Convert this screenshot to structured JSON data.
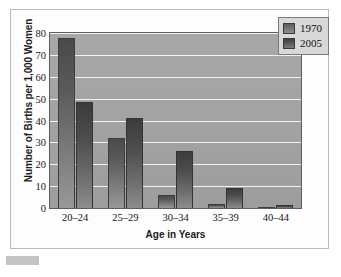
{
  "chart_data": {
    "type": "bar",
    "title": "",
    "xlabel": "Age in Years",
    "ylabel": "Number of Births per 1,000 Women",
    "categories": [
      "20–24",
      "25–29",
      "30–34",
      "35–39",
      "40–44"
    ],
    "series": [
      {
        "name": "1970",
        "values": [
          77.5,
          32,
          6,
          2,
          0.5
        ],
        "color": "#5a5a5a"
      },
      {
        "name": "2005",
        "values": [
          48.5,
          41,
          26,
          9,
          1.5
        ],
        "color": "#4e4e4e"
      }
    ],
    "ylim": [
      0,
      80
    ],
    "yticks": [
      0,
      10,
      20,
      30,
      40,
      50,
      60,
      70,
      80
    ],
    "ytick_labels": [
      "0",
      "10",
      "20",
      "30",
      "40",
      "50",
      "60",
      "70",
      "80"
    ],
    "grid": true,
    "grid_axis": "y",
    "grid_color": "#f2f2f2",
    "legend_position": "top-right",
    "legend_entries": [
      "1970",
      "2005"
    ],
    "plot_background": "#a3a3a3",
    "figure_background": "#ffffff"
  },
  "figure": {
    "frame_border_color": "#b9b9b9",
    "corner_block_color": "#c4c4c4"
  }
}
